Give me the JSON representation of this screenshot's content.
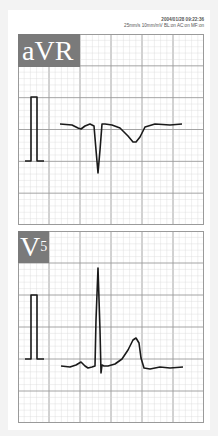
{
  "header": {
    "timestamp": "2004/01/28 09:22:36",
    "settings": "25mm/s 10mm/mV BL:on AC:on MF:on"
  },
  "leads": [
    {
      "name": "aVR",
      "sub": ""
    },
    {
      "name": "V",
      "sub": "5"
    }
  ],
  "colors": {
    "grid_minor": "#d8d8d8",
    "grid_major": "#9a9a9a",
    "trace": "#1a1a1a",
    "label_bg": "#7a7a7a"
  },
  "chart_data": [
    {
      "type": "line",
      "title": "aVR",
      "xlabel": "",
      "ylabel": "",
      "grid": true,
      "calibration_pulse": {
        "x": [
          25,
          31,
          31,
          37,
          37,
          44
        ],
        "y": [
          161,
          161,
          97,
          97,
          161,
          161
        ]
      },
      "trace": {
        "x": [
          60,
          72,
          78,
          81,
          85,
          90,
          94,
          96,
          98,
          100,
          102,
          105,
          112,
          120,
          128,
          133,
          136,
          140,
          145,
          155,
          170,
          182
        ],
        "y": [
          124,
          125,
          128,
          129,
          126,
          124,
          126,
          150,
          173,
          150,
          124,
          124,
          125,
          128,
          136,
          142,
          142,
          137,
          127,
          124,
          125,
          124
        ]
      }
    },
    {
      "type": "line",
      "title": "V5",
      "xlabel": "",
      "ylabel": "",
      "grid": true,
      "calibration_pulse": {
        "x": [
          25,
          31,
          31,
          37,
          37,
          44
        ],
        "y": [
          359,
          359,
          295,
          295,
          359,
          359
        ]
      },
      "trace": {
        "x": [
          61,
          70,
          76,
          81,
          85,
          88,
          92,
          95,
          96,
          98,
          100,
          101,
          102,
          104,
          108,
          115,
          122,
          128,
          133,
          136,
          139,
          141,
          144,
          150,
          160,
          170,
          183
        ],
        "y": [
          366,
          367,
          365,
          362,
          366,
          368,
          367,
          366,
          320,
          268,
          330,
          373,
          365,
          366,
          366,
          364,
          359,
          350,
          340,
          338,
          343,
          358,
          368,
          369,
          367,
          368,
          367
        ]
      }
    }
  ]
}
